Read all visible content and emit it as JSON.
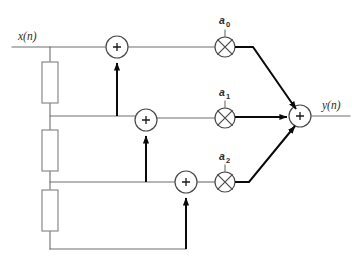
{
  "diagram": {
    "type": "signal-flow-diagram",
    "colors": {
      "signal_line": "#6e6e6e",
      "emphasis_arrow": "#0a0a0a",
      "node_stroke": "#4a4a4a",
      "delay_box_stroke": "#8a8a8a",
      "background": "#ffffff",
      "text": "#2b2b2b"
    },
    "labels": {
      "input": "x(n)",
      "output": "y(n)"
    },
    "coefficients": [
      {
        "id": "a0",
        "base": "a",
        "subscript": "0",
        "x": 225,
        "y": 20
      },
      {
        "id": "a1",
        "base": "a",
        "subscript": "1",
        "x": 225,
        "y": 92
      },
      {
        "id": "a2",
        "base": "a",
        "subscript": "2",
        "x": 225,
        "y": 156
      }
    ],
    "summers": [
      {
        "id": "sum-0",
        "symbol": "+",
        "cx": 117,
        "cy": 47,
        "r": 11
      },
      {
        "id": "sum-1",
        "symbol": "+",
        "cx": 146,
        "cy": 120,
        "r": 11
      },
      {
        "id": "sum-2",
        "symbol": "+",
        "cx": 186,
        "cy": 182,
        "r": 11
      },
      {
        "id": "sum-out",
        "symbol": "+",
        "cx": 300,
        "cy": 116,
        "r": 11
      }
    ],
    "multipliers": [
      {
        "id": "mult-a0",
        "cx": 225,
        "cy": 47,
        "r": 10
      },
      {
        "id": "mult-a1",
        "cx": 225,
        "cy": 118,
        "r": 10
      },
      {
        "id": "mult-a2",
        "cx": 225,
        "cy": 182,
        "r": 10
      }
    ],
    "delays": [
      {
        "id": "delay-0",
        "x": 42,
        "y": 62,
        "width": 16,
        "height": 41
      },
      {
        "id": "delay-1",
        "x": 42,
        "y": 130,
        "width": 16,
        "height": 41
      },
      {
        "id": "delay-2",
        "x": 42,
        "y": 190,
        "width": 16,
        "height": 41
      }
    ],
    "taps": [
      {
        "id": "tap-input",
        "x": 50,
        "y": 47
      },
      {
        "id": "tap-1",
        "x": 50,
        "y": 116
      },
      {
        "id": "tap-2",
        "x": 50,
        "y": 182
      }
    ]
  }
}
